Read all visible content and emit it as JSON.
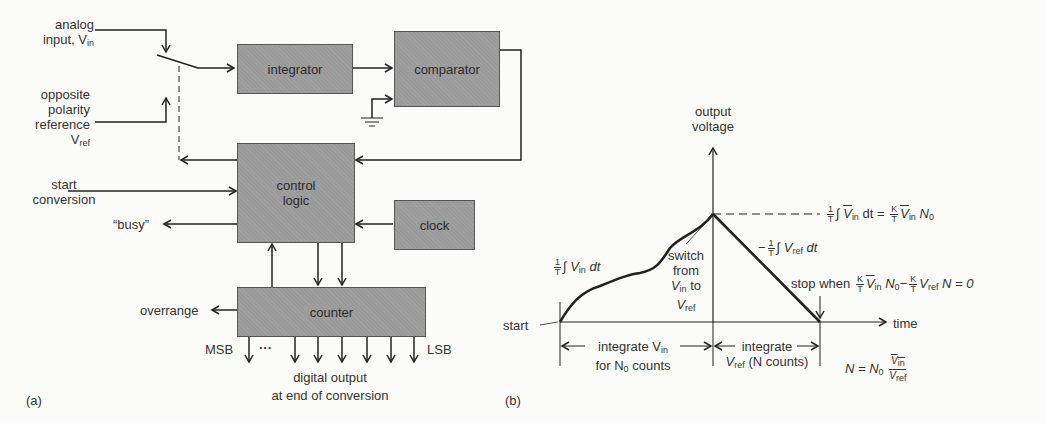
{
  "figure": {
    "panel_a": {
      "label": "(a)",
      "blocks": {
        "integrator": "integrator",
        "comparator": "comparator",
        "control_logic_line1": "control",
        "control_logic_line2": "logic",
        "clock": "clock",
        "counter": "counter"
      },
      "inputs": {
        "analog_input_line1": "analog",
        "analog_input_line2": "input, V",
        "analog_input_sub": "in",
        "reference_line1": "opposite",
        "reference_line2": "polarity",
        "reference_line3": "reference",
        "reference_line4": "V",
        "reference_sub": "ref",
        "start_line1": "start",
        "start_line2": "conversion"
      },
      "outputs": {
        "busy": "“busy”",
        "overrange": "overrange",
        "msb": "MSB",
        "ellipsis": "···",
        "lsb": "LSB",
        "digital_output_line1": "digital output",
        "digital_output_line2": "at end of conversion"
      }
    },
    "panel_b": {
      "label": "(b)",
      "y_axis_line1": "output",
      "y_axis_line2": "voltage",
      "x_axis": "time",
      "start": "start",
      "ramp_up_eq": "∫ V",
      "ramp_up_sub": "in",
      "ramp_up_dt": "dt",
      "switch_line1": "switch",
      "switch_line2": "from",
      "switch_line3_v": "V",
      "switch_line3_sub": "in",
      "switch_line3_to": "to",
      "switch_line4_v": "V",
      "switch_line4_sub": "ref",
      "peak_eq_left": "∫",
      "peak_vin": "V",
      "peak_vin_sub": "in",
      "peak_mid": "dt =",
      "peak_n0": "N",
      "peak_n0_sub": "0",
      "ramp_down_minus": "−",
      "ramp_down_int": "∫ V",
      "ramp_down_sub": "ref",
      "ramp_down_dt": "dt",
      "stop_when": "stop when",
      "stop_eq_n0": "N",
      "stop_eq_minus": "−",
      "stop_vref": "V",
      "stop_vref_sub": "ref",
      "stop_tail": "N = 0",
      "phase1_a": "integrate V",
      "phase1_a_sub": "in",
      "phase1_b": "for N",
      "phase1_b_sub": "0",
      "phase1_b_tail": "counts",
      "phase2_a": "integrate",
      "phase2_b": "V",
      "phase2_b_sub": "ref",
      "phase2_b_tail": "(N counts)",
      "result_lhs": "N = N",
      "result_sub": "0",
      "frac_one": "1",
      "frac_T": "T",
      "frac_K": "K"
    }
  }
}
